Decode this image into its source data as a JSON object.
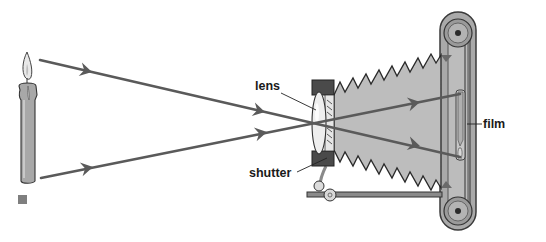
{
  "diagram": {
    "labels": {
      "lens": "lens",
      "shutter": "shutter",
      "film": "film"
    },
    "objects": [
      {
        "name": "candle",
        "description": "lit candle used as the object"
      },
      {
        "name": "light-rays",
        "description": "two rays crossing at the lens, arrowheads show direction"
      },
      {
        "name": "lens",
        "description": "biconvex lens in front of the shutter"
      },
      {
        "name": "shutter",
        "description": "shutter mechanism behind lens"
      },
      {
        "name": "bellows",
        "description": "pleated light-tight bellows"
      },
      {
        "name": "film",
        "description": "film plane at the back showing inverted candle image"
      },
      {
        "name": "film-rollers",
        "description": "two film spools at top and bottom of back plate"
      }
    ],
    "colors": {
      "ray": "#5a5a5a",
      "bellows_fill": "#bdbdbd",
      "lens_holder": "#4a4a4a",
      "candle_wax": "#a8a8a8",
      "back_plate": "#9e9e9e",
      "marker_square": "#7f7f7f"
    }
  }
}
